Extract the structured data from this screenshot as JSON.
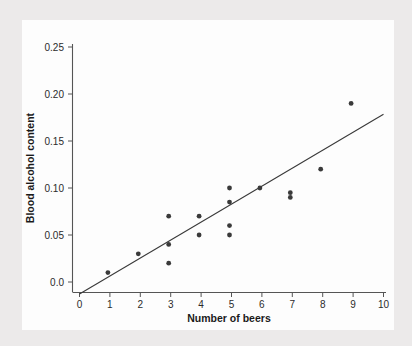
{
  "chart_data": {
    "type": "scatter",
    "title": "",
    "xlabel": "Number of beers",
    "ylabel": "Blood alcohol content",
    "xlim": [
      0,
      10.5
    ],
    "ylim": [
      -0.008,
      0.262
    ],
    "xticks": [
      0,
      1,
      2,
      3,
      4,
      5,
      6,
      7,
      8,
      9,
      10
    ],
    "xtick_labels": [
      "0",
      "1",
      "2",
      "3",
      "4",
      "5",
      "6",
      "7",
      "8",
      "9",
      "10"
    ],
    "yticks": [
      0.0,
      0.05,
      0.1,
      0.15,
      0.2,
      0.25
    ],
    "ytick_labels": [
      "0.0",
      "0.05",
      "0.10",
      "0.15",
      "0.20",
      "0.25"
    ],
    "grid": false,
    "legend": null,
    "point_color": "#3a3a3a",
    "line_color": "#3a3a3a",
    "points": [
      {
        "x": 1,
        "y": 0.01
      },
      {
        "x": 2,
        "y": 0.03
      },
      {
        "x": 3,
        "y": 0.07
      },
      {
        "x": 3,
        "y": 0.04
      },
      {
        "x": 3,
        "y": 0.02
      },
      {
        "x": 4,
        "y": 0.07
      },
      {
        "x": 4,
        "y": 0.05
      },
      {
        "x": 5,
        "y": 0.1
      },
      {
        "x": 5,
        "y": 0.085
      },
      {
        "x": 5,
        "y": 0.06
      },
      {
        "x": 5,
        "y": 0.05
      },
      {
        "x": 6,
        "y": 0.1
      },
      {
        "x": 7,
        "y": 0.095
      },
      {
        "x": 7,
        "y": 0.09
      },
      {
        "x": 8,
        "y": 0.12
      },
      {
        "x": 9,
        "y": 0.19
      }
    ],
    "regression_line": {
      "name": "least-squares fit",
      "x_start": 0.0,
      "y_start": -0.0127,
      "x_end": 10.0,
      "y_end": 0.1784,
      "slope": 0.01796,
      "intercept": -0.0127
    }
  },
  "axes": {
    "x_axis_name": "x-axis",
    "y_axis_name": "y-axis"
  }
}
